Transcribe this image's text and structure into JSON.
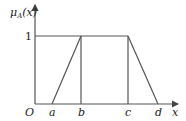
{
  "figure": {
    "y_label": "μ",
    "y_label_sub": "A",
    "y_label_arg": "(x)",
    "level_one": "1",
    "origin": "O",
    "x_label": "x",
    "ticks": [
      "a",
      "b",
      "c",
      "d"
    ]
  },
  "colors": {
    "line": "#555555",
    "text": "#222222"
  }
}
